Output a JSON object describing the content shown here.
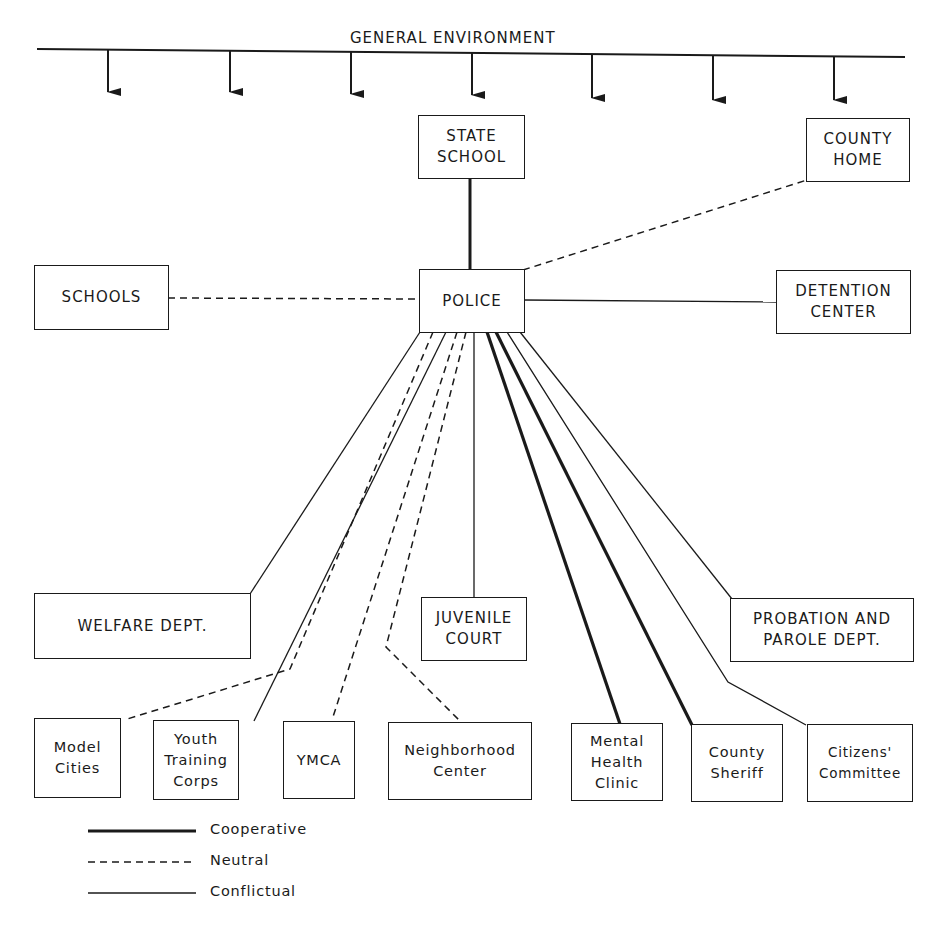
{
  "title": "GENERAL ENVIRONMENT",
  "environment_arrows_x": [
    108,
    230,
    351,
    472,
    592,
    713,
    834
  ],
  "center_node": "POLICE",
  "nodes": {
    "state_school": "STATE\nSCHOOL",
    "county_home": "COUNTY\nHOME",
    "schools": "SCHOOLS",
    "police": "POLICE",
    "detention_center": "DETENTION\nCENTER",
    "welfare_dept": "WELFARE DEPT.",
    "juvenile_court": "JUVENILE\nCOURT",
    "probation_parole": "PROBATION AND\nPAROLE DEPT.",
    "model_cities": "Model\nCities",
    "youth_training_corps": "Youth\nTraining\nCorps",
    "ymca": "YMCA",
    "neighborhood_center": "Neighborhood\nCenter",
    "mental_health_clinic": "Mental\nHealth\nClinic",
    "county_sheriff": "County\nSheriff",
    "citizens_committee": "Citizens'\nCommittee"
  },
  "edges": [
    {
      "from": "POLICE",
      "to": "STATE SCHOOL",
      "type": "Cooperative"
    },
    {
      "from": "POLICE",
      "to": "COUNTY HOME",
      "type": "Neutral"
    },
    {
      "from": "POLICE",
      "to": "SCHOOLS",
      "type": "Neutral"
    },
    {
      "from": "POLICE",
      "to": "DETENTION CENTER",
      "type": "Conflictual"
    },
    {
      "from": "POLICE",
      "to": "WELFARE DEPT.",
      "type": "Conflictual"
    },
    {
      "from": "POLICE",
      "to": "Model Cities",
      "type": "Neutral"
    },
    {
      "from": "POLICE",
      "to": "Youth Training Corps",
      "type": "Conflictual"
    },
    {
      "from": "POLICE",
      "to": "YMCA",
      "type": "Neutral"
    },
    {
      "from": "POLICE",
      "to": "Neighborhood Center",
      "type": "Neutral"
    },
    {
      "from": "POLICE",
      "to": "JUVENILE COURT",
      "type": "Conflictual"
    },
    {
      "from": "POLICE",
      "to": "Mental Health Clinic",
      "type": "Cooperative"
    },
    {
      "from": "POLICE",
      "to": "County Sheriff",
      "type": "Cooperative"
    },
    {
      "from": "POLICE",
      "to": "Citizens' Committee",
      "type": "Conflictual"
    },
    {
      "from": "POLICE",
      "to": "PROBATION AND PAROLE DEPT.",
      "type": "Conflictual"
    }
  ],
  "legend": {
    "cooperative": "Cooperative",
    "neutral": "Neutral",
    "conflictual": "Conflictual"
  }
}
